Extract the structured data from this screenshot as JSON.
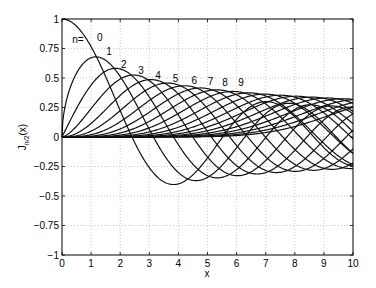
{
  "chart_data": {
    "type": "line",
    "title": "",
    "xlabel": "x",
    "ylabel": "J_{n/2}(x)",
    "xlim": [
      0,
      10
    ],
    "ylim": [
      -1,
      1
    ],
    "grid": true,
    "xticks": [
      "0",
      "1",
      "2",
      "3",
      "4",
      "5",
      "6",
      "7",
      "8",
      "9",
      "10"
    ],
    "yticks": [
      "-1",
      "-0.75",
      "-0.5",
      "-0.25",
      "0",
      "0.25",
      "0.5",
      "0.75",
      "1"
    ],
    "series_description": "Bessel functions of the first kind J_{n/2}(x) for n = 0..19",
    "n_values": [
      0,
      1,
      2,
      3,
      4,
      5,
      6,
      7,
      8,
      9,
      10,
      11,
      12,
      13,
      14,
      15,
      16,
      17,
      18,
      19
    ],
    "annotations": [
      {
        "text": "n=",
        "x": 0.55,
        "y": 0.8
      },
      {
        "text": "0",
        "x": 1.3,
        "y": 0.81
      },
      {
        "text": "1",
        "x": 1.62,
        "y": 0.695
      },
      {
        "text": "2",
        "x": 2.12,
        "y": 0.585
      },
      {
        "text": "3",
        "x": 2.72,
        "y": 0.535
      },
      {
        "text": "4",
        "x": 3.3,
        "y": 0.495
      },
      {
        "text": "5",
        "x": 3.9,
        "y": 0.47
      },
      {
        "text": "6",
        "x": 4.55,
        "y": 0.445
      },
      {
        "text": "7",
        "x": 5.1,
        "y": 0.44
      },
      {
        "text": "8",
        "x": 5.6,
        "y": 0.43
      },
      {
        "text": "9",
        "x": 6.15,
        "y": 0.43
      }
    ]
  }
}
